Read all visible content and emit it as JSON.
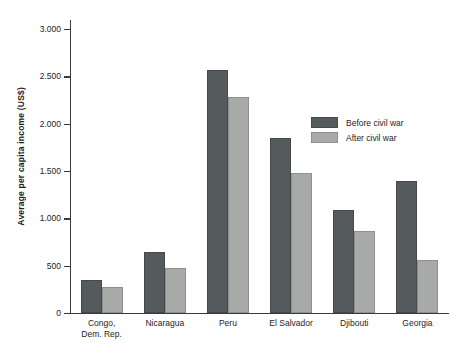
{
  "chart_data": {
    "type": "bar",
    "title": "",
    "xlabel": "",
    "ylabel": "Average per capita income (US$)",
    "ylim": [
      0,
      3000
    ],
    "ytick_labels": [
      "3.000",
      "2.500",
      "2.000",
      "1.500",
      "1.000",
      "500",
      "0"
    ],
    "ytick_values": [
      3000,
      2500,
      2000,
      1500,
      1000,
      500,
      0
    ],
    "grid": false,
    "legend_position": "inside-right",
    "categories": [
      "Congo, Dem. Rep.",
      "Nicaragua",
      "Peru",
      "El Salvador",
      "Djibouti",
      "Georgia"
    ],
    "category_lines": [
      [
        "Congo,",
        "Dem. Rep."
      ],
      [
        "Nicaragua"
      ],
      [
        "Peru"
      ],
      [
        "El Salvador"
      ],
      [
        "Djibouti"
      ],
      [
        "Georgia"
      ]
    ],
    "series": [
      {
        "name": "Before civil war",
        "color": "#555a5c",
        "values": [
          350,
          640,
          2570,
          1850,
          1090,
          1390
        ]
      },
      {
        "name": "After civil war",
        "color": "#a8aaa8",
        "values": [
          270,
          475,
          2280,
          1480,
          865,
          555
        ]
      }
    ]
  },
  "legend": {
    "items": [
      {
        "label": "Before civil war",
        "color": "#555a5c"
      },
      {
        "label": "After civil war",
        "color": "#a8aaa8"
      }
    ]
  }
}
